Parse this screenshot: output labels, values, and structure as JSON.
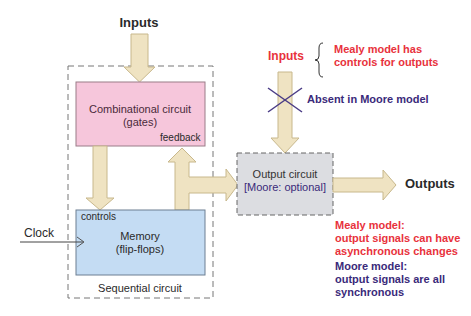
{
  "colors": {
    "arrow_fill": "#efe3c2",
    "arrow_stroke": "#c8b88c",
    "combinational_fill": "#f6c6db",
    "memory_fill": "#c4dcf3",
    "output_fill": "#dcdde1",
    "mealy_red": "#e8323c",
    "moore_purple": "#3a2a7a",
    "text_dark": "#2a2a2a"
  },
  "top_input": {
    "label": "Inputs"
  },
  "sequential": {
    "label": "Sequential circuit",
    "combinational": {
      "line1": "Combinational circuit",
      "line2": "(gates)",
      "feedback_label": "feedback"
    },
    "memory": {
      "controls_label": "controls",
      "line1": "Memory",
      "line2": "(flip-flops)"
    }
  },
  "clock": {
    "label": "Clock"
  },
  "mealy_inputs": {
    "label": "Inputs",
    "note_line1": "Mealy model has",
    "note_line2": "controls for outputs",
    "absent_label": "Absent in Moore model"
  },
  "output_circuit": {
    "line1": "Output circuit",
    "line2": "[Moore: optional]"
  },
  "outputs": {
    "label": "Outputs"
  },
  "notes": {
    "mealy": {
      "line1": "Mealy model:",
      "line2": "output signals can have",
      "line3": "asynchronous changes"
    },
    "moore": {
      "line1": "Moore model:",
      "line2": "output signals are all",
      "line3": "synchronous"
    }
  }
}
